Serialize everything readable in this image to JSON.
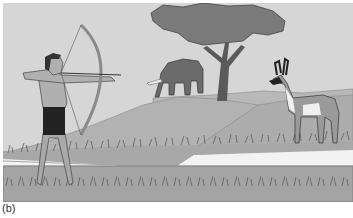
{
  "figure": {
    "caption_label": "(b)",
    "colors": {
      "sky": "#d6d6d6",
      "hill_far": "#b8b8b8",
      "hill_near": "#a9a9a9",
      "path": "#f2f2f2",
      "ground": "#a4a4a4",
      "grass": "#5e5e5e",
      "tree_canopy": "#7a7a7a",
      "tree_trunk": "#5a5a5a",
      "elephant": "#6b6b6b",
      "antelope_body": "#9a9a9a",
      "antelope_marks": "#f0f0f0",
      "archer_skin": "#b0b0b0",
      "archer_loincloth": "#222222",
      "bow": "#8a8a8a",
      "outline": "#3a3a3a"
    }
  }
}
